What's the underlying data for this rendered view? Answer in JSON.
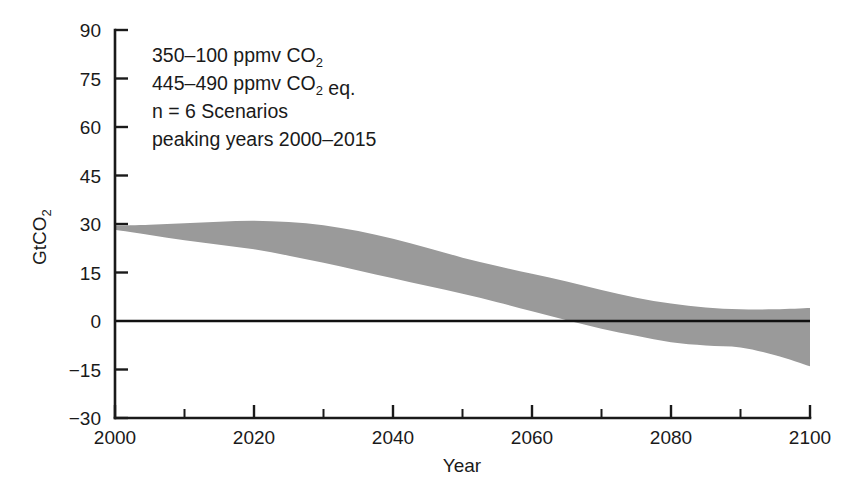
{
  "chart_data": {
    "type": "area",
    "title": "",
    "xlabel": "Year",
    "ylabel": "GtCO2",
    "ylabel_base": "GtCO",
    "ylabel_sub": "2",
    "xlim": [
      2000,
      2100
    ],
    "ylim": [
      -30,
      90
    ],
    "grid": false,
    "legend": "none",
    "x_ticks": [
      2000,
      2020,
      2040,
      2060,
      2080,
      2100
    ],
    "x_minor_ticks": [
      2010,
      2030,
      2050,
      2070,
      2090
    ],
    "y_ticks": [
      -30,
      -15,
      0,
      15,
      30,
      45,
      60,
      75,
      90
    ],
    "y_tick_labels": [
      "−30",
      "−15",
      "0",
      "15",
      "30",
      "45",
      "60",
      "75",
      "90"
    ],
    "x_tick_labels": [
      "2000",
      "2020",
      "2040",
      "2060",
      "2080",
      "2100"
    ],
    "zero_line": 0,
    "band_color": "#9a9a9a",
    "series": [
      {
        "name": "upper bound",
        "x": [
          2000,
          2005,
          2010,
          2015,
          2020,
          2025,
          2030,
          2035,
          2040,
          2045,
          2050,
          2055,
          2060,
          2065,
          2070,
          2075,
          2080,
          2085,
          2090,
          2095,
          2100
        ],
        "values": [
          29.5,
          29.8,
          30.2,
          30.7,
          31.0,
          30.6,
          29.6,
          27.8,
          25.4,
          22.6,
          19.6,
          17.0,
          14.6,
          12.2,
          9.6,
          7.2,
          5.4,
          4.2,
          3.6,
          3.6,
          4.0
        ]
      },
      {
        "name": "lower bound",
        "x": [
          2000,
          2005,
          2010,
          2015,
          2020,
          2025,
          2030,
          2035,
          2040,
          2045,
          2050,
          2055,
          2060,
          2065,
          2070,
          2075,
          2080,
          2085,
          2090,
          2095,
          2100
        ],
        "values": [
          28.2,
          26.6,
          25.0,
          23.6,
          22.2,
          20.2,
          18.0,
          15.6,
          13.2,
          10.8,
          8.4,
          5.8,
          3.0,
          0.2,
          -2.4,
          -4.6,
          -6.6,
          -7.6,
          -8.2,
          -10.6,
          -14.0
        ]
      }
    ],
    "annotation_lines": [
      {
        "parts": [
          {
            "t": "350–100 ppmv CO",
            "sub": false
          },
          {
            "t": "2",
            "sub": true
          }
        ]
      },
      {
        "parts": [
          {
            "t": "445–490 ppmv CO",
            "sub": false
          },
          {
            "t": "2",
            "sub": true
          },
          {
            "t": " eq.",
            "sub": false
          }
        ]
      },
      {
        "parts": [
          {
            "t": "n = 6 Scenarios",
            "sub": false
          }
        ]
      },
      {
        "parts": [
          {
            "t": "peaking years 2000–2015",
            "sub": false
          }
        ]
      }
    ],
    "annotation_plain": [
      "350–100 ppmv CO2",
      "445–490 ppmv CO2 eq.",
      "n = 6 Scenarios",
      "peaking years 2000–2015"
    ]
  }
}
